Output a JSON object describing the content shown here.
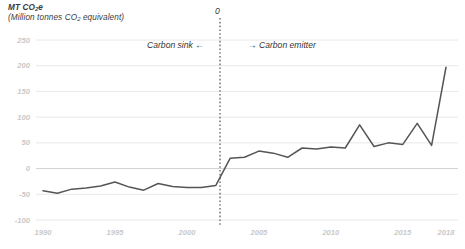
{
  "chart_data": {
    "type": "line",
    "title": "MT CO2e",
    "subtitle": "(Million tonnes CO2 equivalent)",
    "title_line1_pre": "MT CO",
    "title_line1_sub": "2",
    "title_line1_post": "e",
    "title_line2_pre": "(Million tonnes CO",
    "title_line2_sub": "2",
    "title_line2_post": " equivalent)",
    "xlabel": "",
    "ylabel": "MT CO2e (Million tonnes CO2 equivalent)",
    "xlim": [
      1990,
      2018
    ],
    "ylim": [
      -100,
      250
    ],
    "yticks": [
      250,
      200,
      150,
      100,
      50,
      0,
      -50,
      -100
    ],
    "ytick_labels": [
      "250",
      "200",
      "150",
      "100",
      "50",
      "0",
      "-50",
      "-100"
    ],
    "xticks": [
      1990,
      1995,
      2000,
      2005,
      2010,
      2015,
      2018
    ],
    "xtick_labels": [
      "1990",
      "1995",
      "2000",
      "2005",
      "2010",
      "2015",
      "2018"
    ],
    "grid": true,
    "legend": null,
    "line_color": "#555555",
    "grid_color": "#e8e8e8",
    "tick_label_color": "#c9c9c9",
    "annotations": [
      {
        "name": "carbon-sink",
        "text": "Carbon sink ←",
        "x": 1999.0,
        "y": 228
      },
      {
        "name": "carbon-emitter",
        "text": "→ Carbon emitter",
        "x": 2002.8,
        "y": 228
      },
      {
        "name": "zero-crossing-marker",
        "text": "0",
        "x": 2002.3,
        "y": 250
      }
    ],
    "marker_line": {
      "x": 2002.3,
      "label": "0",
      "style": "dotted",
      "color": "#555555"
    },
    "x": [
      1990,
      1991,
      1992,
      1993,
      1994,
      1995,
      1996,
      1997,
      1998,
      1999,
      2000,
      2001,
      2002,
      2003,
      2004,
      2005,
      2006,
      2007,
      2008,
      2009,
      2010,
      2011,
      2012,
      2013,
      2014,
      2015,
      2016,
      2017,
      2018
    ],
    "values": [
      -43,
      -48,
      -40,
      -38,
      -34,
      -26,
      -36,
      -42,
      -29,
      -35,
      -37,
      -37,
      -33,
      20,
      22,
      34,
      30,
      22,
      40,
      38,
      42,
      40,
      85,
      43,
      50,
      47,
      88,
      45,
      197
    ],
    "series": [
      {
        "name": "Net emissions",
        "values": [
          -43,
          -48,
          -40,
          -38,
          -34,
          -26,
          -36,
          -42,
          -29,
          -35,
          -37,
          -37,
          -33,
          20,
          22,
          34,
          30,
          22,
          40,
          38,
          42,
          40,
          85,
          43,
          50,
          47,
          88,
          45,
          197
        ]
      }
    ]
  },
  "axis": {
    "y_title_1": "MT CO2e",
    "y_title_2": "(Million tonnes CO2 equivalent)"
  }
}
